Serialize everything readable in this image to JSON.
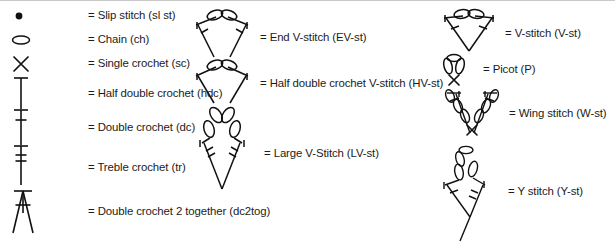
{
  "document": {
    "title": "Crochet stitch symbol key",
    "background_color": "#ffffff",
    "ink_color": "#1b1b1b"
  },
  "columns": [
    {
      "name": "basic-stitches",
      "entries": [
        {
          "symbol": "slip-stitch-symbol",
          "equals": "=",
          "label": "Slip stitch (sl st)",
          "abbr": "sl st"
        },
        {
          "symbol": "chain-symbol",
          "equals": "=",
          "label": "Chain (ch)",
          "abbr": "ch"
        },
        {
          "symbol": "single-crochet-symbol",
          "equals": "=",
          "label": "Single crochet (sc)",
          "abbr": "sc"
        },
        {
          "symbol": "half-double-crochet-symbol",
          "equals": "=",
          "label": "Half double crochet (hdc)",
          "abbr": "hdc"
        },
        {
          "symbol": "double-crochet-symbol",
          "equals": "=",
          "label": "Double crochet (dc)",
          "abbr": "dc"
        },
        {
          "symbol": "treble-crochet-symbol",
          "equals": "=",
          "label": "Treble crochet (tr)",
          "abbr": "tr"
        },
        {
          "symbol": "dc2tog-symbol",
          "equals": "=",
          "label": "Double crochet 2 together (dc2tog)",
          "abbr": "dc2tog"
        }
      ]
    },
    {
      "name": "v-stitch-variants",
      "entries": [
        {
          "symbol": "end-v-stitch-symbol",
          "equals": "=",
          "label": "End V-stitch (EV-st)",
          "abbr": "EV-st"
        },
        {
          "symbol": "half-double-crochet-v-stitch-symbol",
          "equals": "=",
          "label": "Half double crochet V-stitch (HV-st)",
          "abbr": "HV-st"
        },
        {
          "symbol": "large-v-stitch-symbol",
          "equals": "=",
          "label": "Large V-Stitch (LV-st)",
          "abbr": "LV-st"
        }
      ]
    },
    {
      "name": "special-stitches",
      "entries": [
        {
          "symbol": "v-stitch-symbol",
          "equals": "=",
          "label": "V-stitch (V-st)",
          "abbr": "V-st"
        },
        {
          "symbol": "picot-symbol",
          "equals": "=",
          "label": "Picot (P)",
          "abbr": "P"
        },
        {
          "symbol": "wing-stitch-symbol",
          "equals": "=",
          "label": "Wing stitch (W-st)",
          "abbr": "W-st"
        },
        {
          "symbol": "y-stitch-symbol",
          "equals": "=",
          "label": "Y stitch (Y-st)",
          "abbr": "Y-st"
        }
      ]
    }
  ]
}
